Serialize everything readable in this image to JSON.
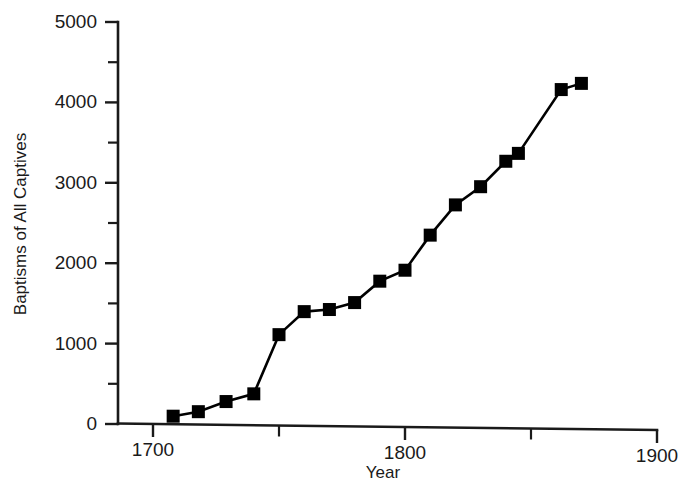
{
  "chart_data": {
    "type": "line",
    "title": "",
    "xlabel": "Year",
    "ylabel": "Baptisms of All Captives",
    "xlim": [
      1700,
      1900
    ],
    "ylim": [
      0,
      5000
    ],
    "grid": false,
    "legend": null,
    "marker": "filled-square",
    "x_ticks_major": [
      1700,
      1800,
      1900
    ],
    "x_ticks_minor": [
      1750,
      1850
    ],
    "x_tick_labels": [
      "1700",
      "1800",
      "1900"
    ],
    "y_ticks_major": [
      0,
      1000,
      2000,
      3000,
      4000,
      5000
    ],
    "y_ticks_minor": [
      500,
      1500,
      2500,
      3500,
      4500
    ],
    "y_tick_labels": [
      "0",
      "1000",
      "2000",
      "3000",
      "4000",
      "5000"
    ],
    "x": [
      1708,
      1718,
      1729,
      1740,
      1750,
      1760,
      1770,
      1780,
      1790,
      1800,
      1810,
      1820,
      1830,
      1840,
      1845,
      1862,
      1870
    ],
    "values": [
      100,
      160,
      290,
      390,
      1130,
      1420,
      1450,
      1540,
      1810,
      1950,
      2390,
      2770,
      3000,
      3320,
      3420,
      4220,
      4300
    ],
    "series": [
      {
        "name": "Baptisms of All Captives",
        "points": [
          {
            "x": 1708,
            "y": 100
          },
          {
            "x": 1718,
            "y": 160
          },
          {
            "x": 1729,
            "y": 290
          },
          {
            "x": 1740,
            "y": 390
          },
          {
            "x": 1750,
            "y": 1130
          },
          {
            "x": 1760,
            "y": 1420
          },
          {
            "x": 1770,
            "y": 1450
          },
          {
            "x": 1780,
            "y": 1540
          },
          {
            "x": 1790,
            "y": 1810
          },
          {
            "x": 1800,
            "y": 1950
          },
          {
            "x": 1810,
            "y": 2390
          },
          {
            "x": 1820,
            "y": 2770
          },
          {
            "x": 1830,
            "y": 3000
          },
          {
            "x": 1840,
            "y": 3320
          },
          {
            "x": 1845,
            "y": 3420
          },
          {
            "x": 1862,
            "y": 4220
          },
          {
            "x": 1870,
            "y": 4300
          }
        ],
        "color": "#000000"
      }
    ],
    "colors": {
      "line": "#000000",
      "marker": "#000000",
      "axis": "#1a1a1a",
      "background": "#ffffff"
    }
  }
}
